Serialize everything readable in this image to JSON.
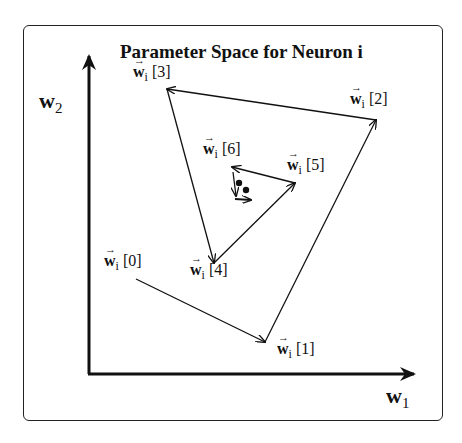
{
  "title": "Parameter Space for Neuron i",
  "axes": {
    "x_label": "w",
    "x_sub": "1",
    "y_label": "w",
    "y_sub": "2"
  },
  "vector_symbol": "w",
  "vector_sub": "i",
  "points": [
    {
      "label": "[0]",
      "x": 136,
      "y": 279
    },
    {
      "label": "[1]",
      "x": 265,
      "y": 342
    },
    {
      "label": "[2]",
      "x": 376,
      "y": 120
    },
    {
      "label": "[3]",
      "x": 167,
      "y": 89
    },
    {
      "label": "[4]",
      "x": 214,
      "y": 263
    },
    {
      "label": "[5]",
      "x": 295,
      "y": 183
    },
    {
      "label": "[6]",
      "x": 232,
      "y": 167
    }
  ],
  "arrow_glyph": "→"
}
